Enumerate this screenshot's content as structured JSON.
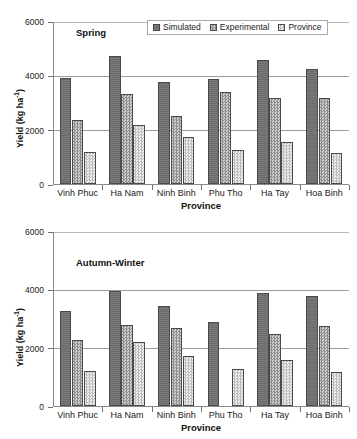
{
  "figure": {
    "background": "#ffffff",
    "axis_title_x": "Province",
    "axis_title_y": "Yield (kg ha",
    "axis_title_y_sup": "-1",
    "axis_title_y_close": ")"
  },
  "legend": {
    "position": "top-right-inside-spring-panel",
    "entries": [
      {
        "label": "Simulated",
        "key": "simulated",
        "swatch": "dark-gray-solid",
        "color": "#6b6b6b"
      },
      {
        "label": "Experimental",
        "key": "experimental",
        "swatch": "mid-gray-checker",
        "color": "#b6b6b6"
      },
      {
        "label": "Province",
        "key": "province",
        "swatch": "light-gray-checker",
        "color": "#dedede"
      }
    ]
  },
  "chart_data": [
    {
      "type": "bar",
      "id": "spring",
      "title": "Spring",
      "xlabel": "Province",
      "ylabel": "Yield (kg ha-1)",
      "ylim": [
        0,
        6000
      ],
      "yticks": [
        0,
        2000,
        4000,
        6000
      ],
      "grid": true,
      "legend_position": "upper right",
      "categories": [
        "Vinh Phuc",
        "Ha Nam",
        "Ninh Binh",
        "Phu Tho",
        "Ha Tay",
        "Hoa Binh"
      ],
      "series": [
        {
          "name": "Simulated",
          "values": [
            3900,
            4700,
            3750,
            3880,
            4550,
            4220
          ]
        },
        {
          "name": "Experimental",
          "values": [
            2370,
            3310,
            2520,
            3390,
            3160,
            3160
          ]
        },
        {
          "name": "Province",
          "values": [
            1180,
            2180,
            1730,
            1250,
            1550,
            1140
          ]
        }
      ]
    },
    {
      "type": "bar",
      "id": "autumn-winter",
      "title": "Autumn-Winter",
      "xlabel": "Province",
      "ylabel": "Yield (kg ha-1)",
      "ylim": [
        0,
        6000
      ],
      "yticks": [
        0,
        2000,
        4000,
        6000
      ],
      "grid": true,
      "legend_position": "none",
      "categories": [
        "Vinh Phuc",
        "Ha Nam",
        "Ninh Binh",
        "Phu Tho",
        "Ha Tay",
        "Hoa Binh"
      ],
      "series": [
        {
          "name": "Simulated",
          "values": [
            3260,
            3930,
            3440,
            2890,
            3890,
            3760
          ]
        },
        {
          "name": "Experimental",
          "values": [
            2280,
            2770,
            2690,
            null,
            2480,
            2760
          ]
        },
        {
          "name": "Province",
          "values": [
            1200,
            2180,
            1720,
            1270,
            1570,
            1170
          ]
        }
      ]
    }
  ]
}
